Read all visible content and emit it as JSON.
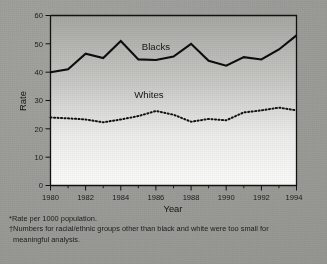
{
  "figure": {
    "background_color": "#9d9d99",
    "plot_background": "#ffffff"
  },
  "footnotes": {
    "note1": "*Rate per 1000 population.",
    "note2_line1": "†Numbers for racial/ethnic groups other than black and white were too small for",
    "note2_line2": "meaningful analysis."
  },
  "chart_data": {
    "type": "line",
    "title": "",
    "xlabel": "Year",
    "ylabel": "Rate",
    "xlim": [
      1980,
      1994
    ],
    "ylim": [
      0,
      60
    ],
    "yticks": [
      0,
      10,
      20,
      30,
      40,
      50,
      60
    ],
    "ytick_labels": [
      "0",
      "10",
      "20",
      "30",
      "40",
      "50",
      "60"
    ],
    "xticks": [
      1980,
      1982,
      1984,
      1986,
      1988,
      1990,
      1992,
      1994
    ],
    "xtick_labels": [
      "1980",
      "1982",
      "1984",
      "1986",
      "1988",
      "1990",
      "1992",
      "1994"
    ],
    "xticks_minor": [
      1981,
      1983,
      1985,
      1987,
      1989,
      1991,
      1993
    ],
    "grid": false,
    "legend_position": "inline-annotation",
    "x": [
      1980,
      1981,
      1982,
      1983,
      1984,
      1985,
      1986,
      1987,
      1988,
      1989,
      1990,
      1991,
      1992,
      1993,
      1994
    ],
    "series": [
      {
        "name": "Blacks",
        "label": "Blacks",
        "style": "solid",
        "color": "#0d0d0d",
        "values": [
          40.0,
          41.0,
          46.5,
          45.0,
          51.0,
          44.5,
          44.3,
          45.5,
          50.0,
          44.0,
          42.3,
          45.3,
          44.5,
          48.0,
          53.0
        ]
      },
      {
        "name": "Whites",
        "label": "Whites",
        "style": "dotted",
        "color": "#111111",
        "values": [
          24.0,
          23.7,
          23.3,
          22.3,
          23.3,
          24.5,
          26.3,
          25.0,
          22.5,
          23.5,
          23.0,
          25.8,
          26.5,
          27.5,
          26.5
        ]
      }
    ],
    "annotations": [
      {
        "text": "Blacks",
        "x": 1986.0,
        "y": 48.0
      },
      {
        "text": "Whites",
        "x": 1985.6,
        "y": 31.0
      }
    ]
  }
}
